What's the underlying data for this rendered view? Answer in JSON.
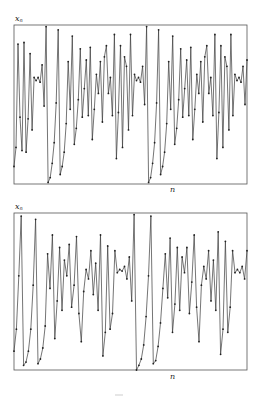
{
  "figure": {
    "panels": [
      {
        "id": "top",
        "ylabel": "x",
        "ylabel_sub": "n",
        "xlabel": "n"
      },
      {
        "id": "bottom",
        "ylabel": "x",
        "ylabel_sub": "n",
        "xlabel": "n"
      }
    ],
    "colors": {
      "line": "#3a3a3a",
      "frame": "#555555",
      "marker": "#222222",
      "background": "#ffffff"
    }
  },
  "chart_data": [
    {
      "type": "line",
      "title": "",
      "xlabel": "n",
      "ylabel": "x_n",
      "grid": false,
      "ylim": [
        0,
        1
      ],
      "markers": true,
      "x_pixel_range": [
        14,
        247
      ],
      "values": [
        0.11,
        0.23,
        0.88,
        0.42,
        0.21,
        0.89,
        0.2,
        0.41,
        0.82,
        0.34,
        0.67,
        0.65,
        0.67,
        0.64,
        0.75,
        0.49,
        0.99,
        0.01,
        0.04,
        0.13,
        0.26,
        0.51,
        0.97,
        0.06,
        0.11,
        0.2,
        0.38,
        0.77,
        0.47,
        0.93,
        0.25,
        0.35,
        0.53,
        0.85,
        0.42,
        0.6,
        0.78,
        0.43,
        0.86,
        0.28,
        0.47,
        0.69,
        0.57,
        0.77,
        0.39,
        0.8,
        0.87,
        0.57,
        0.67,
        0.43,
        0.94,
        0.16,
        0.45,
        0.87,
        0.23,
        0.8,
        0.74,
        0.34,
        0.94,
        0.43,
        0.69,
        0.65,
        0.67,
        0.64,
        0.74,
        0.5,
        0.99,
        0.01,
        0.04,
        0.13,
        0.26,
        0.51,
        0.97,
        0.06,
        0.11,
        0.2,
        0.38,
        0.77,
        0.47,
        0.93,
        0.25,
        0.35,
        0.53,
        0.85,
        0.42,
        0.6,
        0.78,
        0.43,
        0.86,
        0.28,
        0.47,
        0.69,
        0.57,
        0.77,
        0.39,
        0.8,
        0.87,
        0.57,
        0.67,
        0.43,
        0.94,
        0.16,
        0.45,
        0.87,
        0.23,
        0.8,
        0.74,
        0.34,
        0.94,
        0.43,
        0.69,
        0.65,
        0.67,
        0.64,
        0.74,
        0.5,
        0.78
      ]
    },
    {
      "type": "line",
      "title": "",
      "xlabel": "n",
      "ylabel": "x_n",
      "grid": false,
      "ylim": [
        0,
        1
      ],
      "markers": true,
      "x_pixel_range": [
        14,
        247
      ],
      "values": [
        0.12,
        0.26,
        0.6,
        0.98,
        0.03,
        0.05,
        0.12,
        0.26,
        0.54,
        0.96,
        0.04,
        0.07,
        0.14,
        0.28,
        0.74,
        0.52,
        0.86,
        0.2,
        0.44,
        0.78,
        0.38,
        0.7,
        0.6,
        0.8,
        0.4,
        0.54,
        0.85,
        0.36,
        0.18,
        0.5,
        0.64,
        0.58,
        0.76,
        0.48,
        0.68,
        0.38,
        0.86,
        0.09,
        0.24,
        0.79,
        0.26,
        0.36,
        0.76,
        0.62,
        0.64,
        0.63,
        0.66,
        0.58,
        0.72,
        0.44,
        0.99,
        0.0,
        0.03,
        0.07,
        0.16,
        0.34,
        0.6,
        0.98,
        0.04,
        0.06,
        0.15,
        0.3,
        0.52,
        0.74,
        0.46,
        0.84,
        0.24,
        0.42,
        0.78,
        0.38,
        0.72,
        0.62,
        0.78,
        0.36,
        0.56,
        0.86,
        0.4,
        0.18,
        0.54,
        0.66,
        0.58,
        0.76,
        0.44,
        0.7,
        0.38,
        0.88,
        0.1,
        0.26,
        0.82,
        0.24,
        0.4,
        0.76,
        0.62,
        0.64,
        0.62,
        0.66,
        0.58,
        0.76
      ]
    }
  ]
}
